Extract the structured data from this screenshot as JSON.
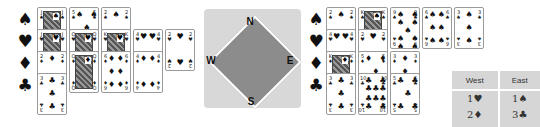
{
  "suits": {
    "spades": "♠",
    "hearts": "♥",
    "diamonds": "♦",
    "clubs": "♣"
  },
  "west_hand": {
    "spades": [
      {
        "rank": "J",
        "face": true
      },
      {
        "rank": "5",
        "face": false
      },
      {
        "rank": "2",
        "face": false
      }
    ],
    "hearts": [
      {
        "rank": "J",
        "face": true
      },
      {
        "rank": "Q",
        "face": true
      },
      {
        "rank": "K",
        "face": true
      },
      {
        "rank": "4",
        "face": false
      },
      {
        "rank": "2",
        "face": false
      }
    ],
    "diamonds": [
      {
        "rank": "2",
        "face": false
      },
      {
        "rank": "Q",
        "face": true
      },
      {
        "rank": "6",
        "face": false
      },
      {
        "rank": "4",
        "face": false
      }
    ],
    "clubs": [
      {
        "rank": "3",
        "face": false
      }
    ]
  },
  "east_hand": {
    "spades": [
      {
        "rank": "2",
        "face": false
      },
      {
        "rank": "K",
        "face": true
      },
      {
        "rank": "9",
        "face": false
      },
      {
        "rank": "6",
        "face": false
      },
      {
        "rank": "3",
        "face": false
      }
    ],
    "hearts": [
      {
        "rank": "4",
        "face": false
      },
      {
        "rank": "2",
        "face": false
      }
    ],
    "diamonds": [
      {
        "rank": "K",
        "face": true
      },
      {
        "rank": "5",
        "face": false
      },
      {
        "rank": "3",
        "face": false
      }
    ],
    "clubs": [
      {
        "rank": "3",
        "face": false
      },
      {
        "rank": "10",
        "face": false
      },
      {
        "rank": "5",
        "face": false
      }
    ]
  },
  "compass": {
    "north": "N",
    "south": "S",
    "east": "E",
    "west": "W"
  },
  "bidding": {
    "headers": [
      "West",
      "East"
    ],
    "rows": [
      [
        "1♥",
        "1♠"
      ],
      [
        "2♦",
        "3♣"
      ],
      [
        "3♠",
        "4♠"
      ]
    ]
  }
}
